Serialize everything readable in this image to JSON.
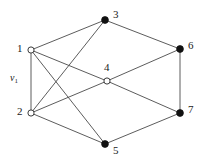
{
  "figure": {
    "type": "undirected-graph-diagram",
    "width": 206,
    "height": 163,
    "background_color": "#ffffff",
    "edge_color": "#4a4a4a",
    "filled_node_color": "#111111",
    "hollow_node_fill": "#ffffff",
    "hollow_node_stroke": "#3c3c3c"
  },
  "graph_data": {
    "type": "graph",
    "node_count": 7,
    "edge_count": 12,
    "nodes": [
      {
        "id": "1",
        "label": "1",
        "x": 31,
        "y": 50,
        "style": "hollow",
        "label_x": 17,
        "label_y": 43
      },
      {
        "id": "2",
        "label": "2",
        "x": 31,
        "y": 113,
        "style": "hollow",
        "label_x": 17,
        "label_y": 106
      },
      {
        "id": "3",
        "label": "3",
        "x": 105,
        "y": 20,
        "style": "filled",
        "label_x": 113,
        "label_y": 9
      },
      {
        "id": "4",
        "label": "4",
        "x": 107,
        "y": 81,
        "style": "hollow",
        "label_x": 104,
        "label_y": 62
      },
      {
        "id": "5",
        "label": "5",
        "x": 105,
        "y": 144,
        "style": "filled",
        "label_x": 113,
        "label_y": 145
      },
      {
        "id": "6",
        "label": "6",
        "x": 180,
        "y": 49,
        "style": "filled",
        "label_x": 188,
        "label_y": 40
      },
      {
        "id": "7",
        "label": "7",
        "x": 180,
        "y": 113,
        "style": "filled",
        "label_x": 188,
        "label_y": 104
      }
    ],
    "edges": [
      {
        "source": "1",
        "target": "3"
      },
      {
        "source": "1",
        "target": "2"
      },
      {
        "source": "1",
        "target": "4"
      },
      {
        "source": "1",
        "target": "5"
      },
      {
        "source": "2",
        "target": "3"
      },
      {
        "source": "2",
        "target": "4"
      },
      {
        "source": "2",
        "target": "5"
      },
      {
        "source": "3",
        "target": "6"
      },
      {
        "source": "4",
        "target": "6"
      },
      {
        "source": "4",
        "target": "7"
      },
      {
        "source": "5",
        "target": "7"
      },
      {
        "source": "6",
        "target": "7"
      }
    ],
    "edge_labels": [
      {
        "id": "v1",
        "text": "v",
        "subscript": "1",
        "for_edge": {
          "source": "1",
          "target": "2"
        },
        "x": 10,
        "y": 73
      }
    ]
  }
}
